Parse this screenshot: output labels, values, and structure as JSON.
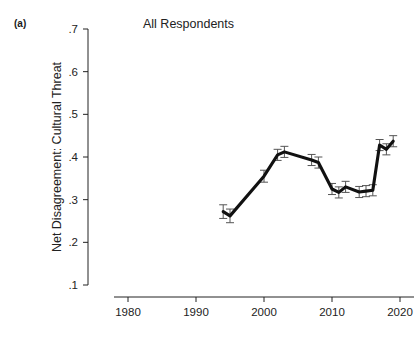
{
  "figure": {
    "panel_label": "(a)",
    "title": "All Respondents",
    "ylabel": "Net Disagreement: Cultural Threat"
  },
  "chart_data": {
    "type": "line",
    "title": "All Respondents",
    "xlabel": "",
    "ylabel": "Net Disagreement: Cultural Threat",
    "xlim": [
      1978,
      2022
    ],
    "ylim": [
      0.1,
      0.7
    ],
    "xticks": [
      1980,
      1990,
      2000,
      2010,
      2020
    ],
    "xtick_labels": [
      "1980",
      "1990",
      "2000",
      "2010",
      "2020"
    ],
    "yticks": [
      0.1,
      0.2,
      0.3,
      0.4,
      0.5,
      0.6,
      0.7
    ],
    "ytick_labels": [
      ".1",
      ".2",
      ".3",
      ".4",
      ".5",
      ".6",
      ".7"
    ],
    "grid": false,
    "legend": false,
    "error_bars": true,
    "series": [
      {
        "name": "All Respondents",
        "x": [
          1994,
          1995,
          2000,
          2002,
          2003,
          2007,
          2008,
          2010,
          2011,
          2012,
          2014,
          2015,
          2016,
          2017,
          2018,
          2019
        ],
        "values": [
          0.272,
          0.262,
          0.355,
          0.405,
          0.412,
          0.393,
          0.387,
          0.325,
          0.317,
          0.33,
          0.318,
          0.32,
          0.322,
          0.428,
          0.418,
          0.437
        ],
        "errors": [
          0.016,
          0.016,
          0.014,
          0.013,
          0.013,
          0.013,
          0.013,
          0.013,
          0.013,
          0.013,
          0.013,
          0.013,
          0.013,
          0.013,
          0.013,
          0.013
        ]
      }
    ]
  }
}
